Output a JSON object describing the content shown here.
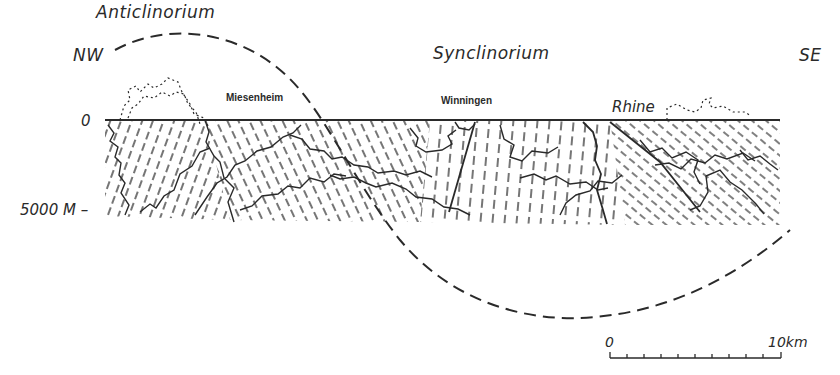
{
  "diagram": {
    "type": "geological-cross-section",
    "structures": {
      "anticline": "Anticlinorium",
      "syncline": "Synclinorium"
    },
    "directions": {
      "left": "NW",
      "right": "SE"
    },
    "places": {
      "p1": "Miesenheim",
      "p2": "Winningen",
      "p3": "Rhine"
    },
    "depth_axis": {
      "top": "0",
      "bottom": "5000 M –"
    },
    "scale_bar": {
      "start": "0",
      "end": "10km",
      "ticks": 10
    },
    "colors": {
      "ink": "#2a2a2a",
      "background": "#ffffff"
    }
  }
}
